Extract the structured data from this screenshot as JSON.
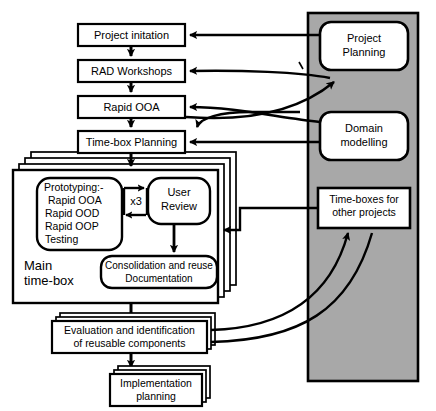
{
  "diagram": {
    "colors": {
      "background": "#ffffff",
      "panel_fill": "#a8a8a8",
      "box_fill": "#ffffff",
      "stroke": "#000000"
    },
    "main_flow": [
      {
        "id": "project-initiation",
        "label": "Project initation"
      },
      {
        "id": "rad-workshops",
        "label": "RAD Workshops"
      },
      {
        "id": "rapid-ooa",
        "label": "Rapid OOA"
      },
      {
        "id": "time-box-planning",
        "label": "Time-box Planning"
      }
    ],
    "time_box": {
      "frame_label_line1": "Main",
      "frame_label_line2": "time-box",
      "prototyping": {
        "line1": "Prototyping:-",
        "line2": "Rapid OOA",
        "line3": "Rapid OOD",
        "line4": "Rapid OOP",
        "line5": "Testing"
      },
      "iteration_label": "x3",
      "user_review": {
        "line1": "User",
        "line2": "Review"
      },
      "consolidation": {
        "line1": "Consolidation and reuse",
        "line2": "Documentation"
      }
    },
    "outputs": [
      {
        "id": "evaluation",
        "line1": "Evaluation and identification",
        "line2": "of reusable components"
      },
      {
        "id": "implementation",
        "line1": "Implementation",
        "line2": "planning"
      }
    ],
    "panel": {
      "boxes": [
        {
          "id": "project-planning",
          "line1": "Project",
          "line2": "Planning"
        },
        {
          "id": "domain-modelling",
          "line1": "Domain",
          "line2": "modelling"
        },
        {
          "id": "time-boxes-other",
          "line1": "Time-boxes for",
          "line2": "other projects"
        }
      ]
    }
  }
}
